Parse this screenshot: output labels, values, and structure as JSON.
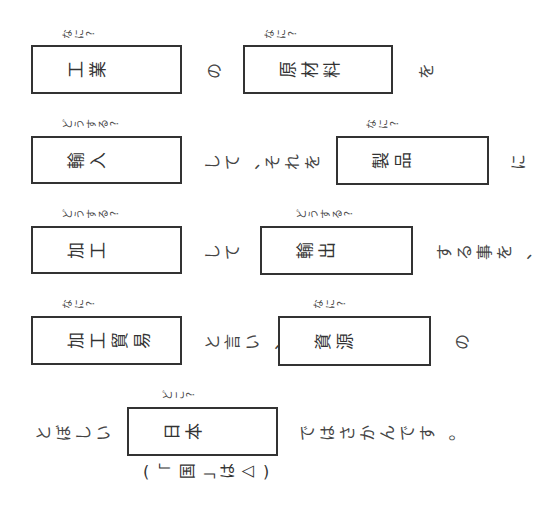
{
  "worksheet": {
    "rows": [
      {
        "items": [
          {
            "type": "hint",
            "text": "なに?",
            "x": 60,
            "y": 33
          },
          {
            "type": "box",
            "x": 31,
            "y": 45,
            "w": 151,
            "h": 49,
            "answer": "工業"
          },
          {
            "type": "connector",
            "text": "の",
            "x": 203,
            "y": 69
          },
          {
            "type": "hint",
            "text": "なに?",
            "x": 262,
            "y": 33
          },
          {
            "type": "box",
            "x": 243,
            "y": 45,
            "w": 150,
            "h": 49,
            "answer": "原材料"
          },
          {
            "type": "connector",
            "text": "を",
            "x": 415,
            "y": 69
          }
        ]
      },
      {
        "items": [
          {
            "type": "hint",
            "text": "どうする?",
            "x": 60,
            "y": 123
          },
          {
            "type": "box",
            "x": 31,
            "y": 136,
            "w": 151,
            "h": 48,
            "answer": "輸入"
          },
          {
            "type": "connector",
            "text": "して、それを",
            "x": 201,
            "y": 160
          },
          {
            "type": "hint",
            "text": "なに?",
            "x": 364,
            "y": 123
          },
          {
            "type": "box",
            "x": 336,
            "y": 136,
            "w": 153,
            "h": 49,
            "answer": "製品"
          },
          {
            "type": "connector",
            "text": "に",
            "x": 507,
            "y": 160
          }
        ]
      },
      {
        "items": [
          {
            "type": "hint",
            "text": "どうする?",
            "x": 60,
            "y": 213
          },
          {
            "type": "box",
            "x": 31,
            "y": 226,
            "w": 151,
            "h": 48,
            "answer": "加工"
          },
          {
            "type": "connector",
            "text": "して",
            "x": 201,
            "y": 250
          },
          {
            "type": "hint",
            "text": "どうする?",
            "x": 294,
            "y": 213
          },
          {
            "type": "box",
            "x": 260,
            "y": 226,
            "w": 153,
            "h": 49,
            "answer": "輸出"
          },
          {
            "type": "connector",
            "text": "する事を、",
            "x": 433,
            "y": 250
          }
        ]
      },
      {
        "items": [
          {
            "type": "hint",
            "text": "なに?",
            "x": 60,
            "y": 303
          },
          {
            "type": "box",
            "x": 31,
            "y": 316,
            "w": 151,
            "h": 49,
            "answer": "加工貿易"
          },
          {
            "type": "connector",
            "text": "と言い、",
            "x": 201,
            "y": 340
          },
          {
            "type": "hint",
            "text": "なに?",
            "x": 311,
            "y": 303
          },
          {
            "type": "box",
            "x": 278,
            "y": 316,
            "w": 153,
            "h": 50,
            "answer": "資源"
          },
          {
            "type": "connector",
            "text": "の",
            "x": 451,
            "y": 340
          }
        ]
      },
      {
        "items": [
          {
            "type": "connector",
            "text": "とぼしい",
            "x": 32,
            "y": 431
          },
          {
            "type": "hint",
            "text": "どこ?",
            "x": 160,
            "y": 394
          },
          {
            "type": "box",
            "x": 127,
            "y": 407,
            "w": 151,
            "h": 49,
            "answer": "日本"
          },
          {
            "type": "connector",
            "text": "ではさかんです。",
            "x": 296,
            "y": 431
          }
        ]
      }
    ],
    "note": {
      "open_paren": "(",
      "bracket_open": "「",
      "kanji": "国",
      "bracket_close": "」",
      "particle": "は",
      "symbol": "△",
      "close_paren": ")",
      "x": 136,
      "y": 469
    }
  }
}
